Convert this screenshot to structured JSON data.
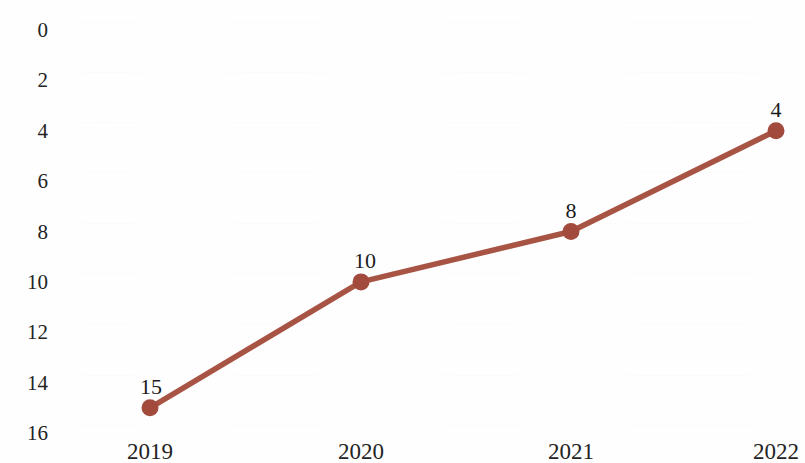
{
  "chart_data": {
    "type": "line",
    "title": "",
    "subtitle": "",
    "xlabel": "",
    "ylabel": "",
    "categories": [
      "2019",
      "2020",
      "2021",
      "2022"
    ],
    "series": [
      {
        "name": "",
        "values": [
          15,
          10,
          8,
          4
        ],
        "color": "#a85444",
        "marker": "circle",
        "show_data_labels": true
      }
    ],
    "data_labels": [
      "15",
      "10",
      "8",
      "4"
    ],
    "y_ticks": [
      0,
      2,
      4,
      6,
      8,
      10,
      12,
      14,
      16
    ],
    "y_tick_labels": [
      "0",
      "2",
      "4",
      "6",
      "8",
      "10",
      "12",
      "14",
      "16"
    ],
    "ylim": [
      0,
      16
    ],
    "y_axis_inverted": true,
    "x_tick_labels": [
      "2019",
      "2020",
      "2021",
      "2022"
    ],
    "grid": "faint-horizontal",
    "legend": "none",
    "background_color": "#ffffff",
    "line_color": "#a85444",
    "marker_color": "#a24a3c",
    "text_color": "#232323"
  },
  "geometry": {
    "width": 805,
    "height": 463,
    "y_top_px": 30,
    "y_bottom_px": 433,
    "x_positions_px": [
      150,
      361,
      571,
      776
    ]
  }
}
